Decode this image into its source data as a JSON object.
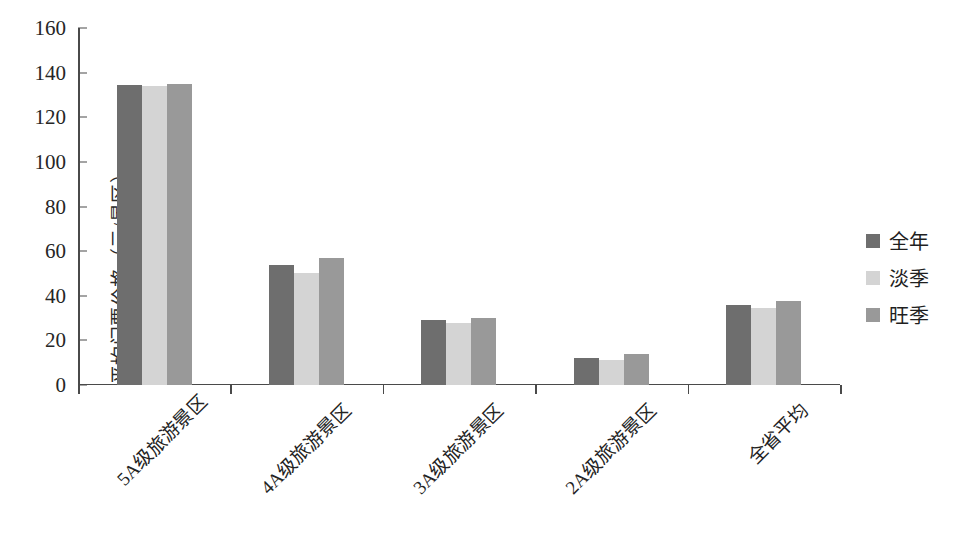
{
  "chart_data": {
    "type": "bar",
    "title": "",
    "subtitle": "",
    "xlabel": "",
    "ylabel": "平均门票价格（元/景区）",
    "categories": [
      "5A级旅游景区",
      "4A级旅游景区",
      "3A级旅游景区",
      "2A级旅游景区",
      "全省平均"
    ],
    "series": [
      {
        "name": "全年",
        "color": "#6e6e6e",
        "values": [
          134.5,
          54,
          29,
          12,
          36
        ]
      },
      {
        "name": "淡季",
        "color": "#d4d4d4",
        "values": [
          134,
          50,
          28,
          11,
          34.5
        ]
      },
      {
        "name": "旺季",
        "color": "#999999",
        "values": [
          135,
          57,
          30,
          14,
          37.5
        ]
      }
    ],
    "ylim": [
      0,
      160
    ],
    "ytick_step": 20,
    "yticks": [
      "160",
      "140",
      "120",
      "100",
      "80",
      "60",
      "40",
      "20",
      "0"
    ],
    "grid": false,
    "legend_position": "right",
    "xlabel_rotation": -45
  },
  "axis": {
    "line_color": "#4a4a4a"
  }
}
